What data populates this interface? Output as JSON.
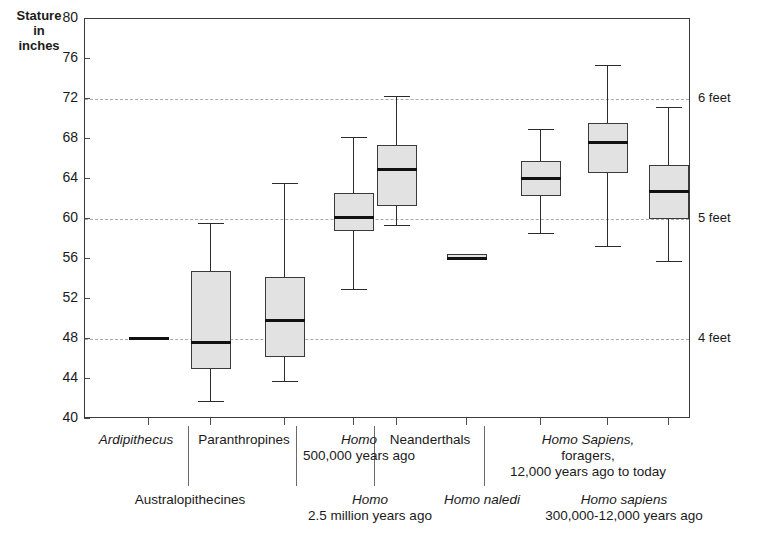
{
  "axis": {
    "y_title_lines": [
      "Stature",
      "in",
      "inches"
    ],
    "y_ticks": [
      80,
      76,
      72,
      68,
      64,
      60,
      56,
      52,
      48,
      44,
      40
    ],
    "y_min": 40,
    "y_max": 80
  },
  "reference_lines": [
    {
      "value": 72,
      "label": "6 feet"
    },
    {
      "value": 60,
      "label": "5 feet"
    },
    {
      "value": 48,
      "label": "4 feet"
    }
  ],
  "top_labels": [
    {
      "name": "Ardipithecus",
      "italic": true,
      "line2": ""
    },
    {
      "name": "Paranthropines",
      "italic": false,
      "line2": ""
    },
    {
      "name": "Homo",
      "italic": true,
      "line2": "500,000 years ago"
    },
    {
      "name": "Neanderthals",
      "italic": false,
      "line2": ""
    },
    {
      "name": "Homo Sapiens,",
      "italic": true,
      "line2": "foragers,",
      "line3": "12,000 years ago to today"
    }
  ],
  "bottom_labels": [
    {
      "name": "Australopithecines",
      "italic": false,
      "line2": ""
    },
    {
      "name": "Homo",
      "italic": true,
      "line2": "2.5 million years ago"
    },
    {
      "name": "Homo naledi",
      "italic": true,
      "line2": ""
    },
    {
      "name": "Homo sapiens",
      "italic": true,
      "line2": "300,000-12,000 years ago"
    }
  ],
  "chart_data": {
    "type": "box",
    "title": "",
    "xlabel": "",
    "ylabel": "Stature in inches",
    "ylim": [
      40,
      80
    ],
    "ytick_step": 4,
    "grid": "horizontal-dashed-at-48-60-72",
    "legend": "none",
    "categories": [
      "Ardipithecus",
      "Australopithecines",
      "Paranthropines",
      "Homo 2.5 million years ago",
      "Homo 500,000 years ago",
      "Homo naledi",
      "Neanderthals",
      "Homo sapiens 300,000-12,000 years ago",
      "Homo Sapiens, foragers, 12,000 years ago to today"
    ],
    "boxes": [
      {
        "category": "Ardipithecus",
        "min": 48.2,
        "q1": 48.2,
        "median": 48.2,
        "q3": 48.2,
        "max": 48.2,
        "degenerate": true
      },
      {
        "category": "Australopithecines",
        "min": 41.8,
        "q1": 45.0,
        "median": 47.8,
        "q3": 54.8,
        "max": 59.6
      },
      {
        "category": "Paranthropines",
        "min": 43.8,
        "q1": 46.2,
        "median": 50.0,
        "q3": 54.2,
        "max": 63.6
      },
      {
        "category": "Homo 2.5 million years ago",
        "min": 53.0,
        "q1": 58.8,
        "median": 60.3,
        "q3": 62.6,
        "max": 68.2
      },
      {
        "category": "Homo 500,000 years ago",
        "min": 59.4,
        "q1": 61.3,
        "median": 65.1,
        "q3": 67.4,
        "max": 72.3
      },
      {
        "category": "Homo naledi",
        "min": 56.0,
        "q1": 56.0,
        "median": 56.2,
        "q3": 56.5,
        "max": 56.5,
        "degenerate": true
      },
      {
        "category": "Neanderthals",
        "min": 58.6,
        "q1": 62.3,
        "median": 64.2,
        "q3": 65.8,
        "max": 69.0
      },
      {
        "category": "Homo sapiens 300,000-12,000 years ago",
        "min": 57.3,
        "q1": 64.6,
        "median": 67.8,
        "q3": 69.6,
        "max": 75.4
      },
      {
        "category": "Homo Sapiens, foragers, 12,000 years ago to today",
        "min": 55.8,
        "q1": 60.0,
        "median": 62.9,
        "q3": 65.4,
        "max": 71.2
      }
    ]
  },
  "colors": {
    "box_fill": "#e2e2e2",
    "box_stroke": "#3a3a3a",
    "median": "#111111",
    "gridline": "#a9a9a9",
    "axis": "#3a3a3a",
    "text": "#1a1a1a",
    "background": "#ffffff"
  }
}
